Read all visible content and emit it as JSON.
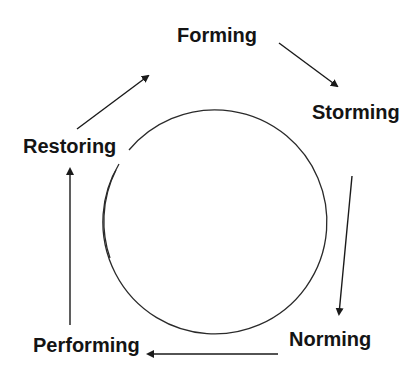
{
  "diagram": {
    "type": "cycle",
    "stages": [
      {
        "id": "forming",
        "label": "Forming"
      },
      {
        "id": "storming",
        "label": "Storming"
      },
      {
        "id": "norming",
        "label": "Norming"
      },
      {
        "id": "performing",
        "label": "Performing"
      },
      {
        "id": "restoring",
        "label": "Restoring"
      }
    ],
    "flow": [
      [
        "Forming",
        "Storming"
      ],
      [
        "Storming",
        "Norming"
      ],
      [
        "Norming",
        "Performing"
      ],
      [
        "Performing",
        "Restoring"
      ],
      [
        "Restoring",
        "Forming"
      ]
    ],
    "colors": {
      "text": "#141414",
      "stroke": "#2a2a2a",
      "background": "#ffffff"
    }
  }
}
